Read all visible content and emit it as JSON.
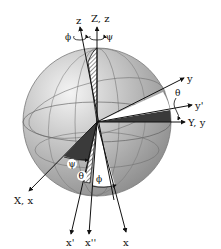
{
  "diagram": {
    "axes": {
      "Z_z": "Z, z",
      "z_tilted": "z",
      "y": "y",
      "y_prime": "y'",
      "Y_y": "Y, y",
      "X_x": "X, x",
      "x_prime": "x'",
      "x_double_prime": "x''",
      "x": "x"
    },
    "angles": {
      "phi_top": "ϕ",
      "psi_top": "ψ",
      "theta_right": "θ",
      "psi_bottom": "ψ",
      "theta_bottom": "θ",
      "phi_bottom": "ϕ"
    },
    "colors": {
      "sphere_light": "#e6e6e6",
      "sphere_dark": "#8a8a8a",
      "wedge_dark": "#3a3a3a",
      "line": "#111111"
    }
  }
}
